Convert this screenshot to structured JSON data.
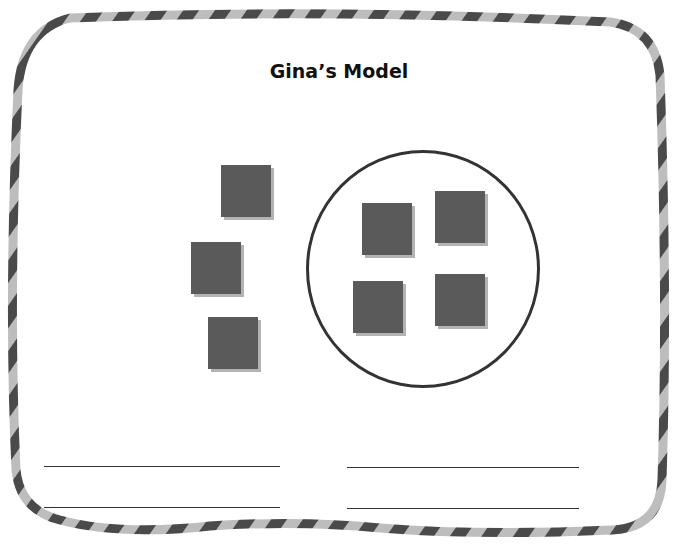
{
  "title": "Gina’s Model",
  "colors": {
    "counter": "#5a5a5a",
    "counter_shadow": "#b3b3b3",
    "circle_stroke": "#333333",
    "line": "#333333",
    "border_dark": "#4a4a4a",
    "border_light": "#b8b8b8"
  },
  "model": {
    "outside_counters": 3,
    "inside_circle_counters": 4,
    "total_counters": 7
  },
  "answer_lines": {
    "left_count": 2,
    "right_count": 2
  }
}
